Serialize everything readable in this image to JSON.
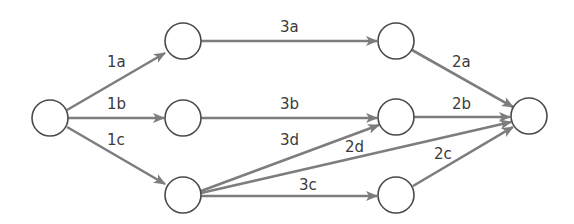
{
  "diagram": {
    "type": "directed-network",
    "colors": {
      "edge": "#7d7d7d",
      "node_stroke": "#4a4a4a",
      "label": "#3a3a3a",
      "background": "#ffffff"
    },
    "nodes": [
      {
        "id": "source",
        "x": 50,
        "y": 118
      },
      {
        "id": "a1",
        "x": 183,
        "y": 41
      },
      {
        "id": "b1",
        "x": 183,
        "y": 118
      },
      {
        "id": "c1",
        "x": 183,
        "y": 195
      },
      {
        "id": "a2",
        "x": 396,
        "y": 41
      },
      {
        "id": "b2",
        "x": 396,
        "y": 117
      },
      {
        "id": "c2",
        "x": 396,
        "y": 195
      },
      {
        "id": "sink",
        "x": 529,
        "y": 116
      }
    ],
    "edges": [
      {
        "from": "source",
        "to": "a1",
        "label": "1a"
      },
      {
        "from": "source",
        "to": "b1",
        "label": "1b"
      },
      {
        "from": "source",
        "to": "c1",
        "label": "1c"
      },
      {
        "from": "a1",
        "to": "a2",
        "label": "3a"
      },
      {
        "from": "b1",
        "to": "b2",
        "label": "3b"
      },
      {
        "from": "c1",
        "to": "b2",
        "label": "3d"
      },
      {
        "from": "c1",
        "to": "c2",
        "label": "3c"
      },
      {
        "from": "c1",
        "to": "sink",
        "label": "2d"
      },
      {
        "from": "a2",
        "to": "sink",
        "label": "2a"
      },
      {
        "from": "b2",
        "to": "sink",
        "label": "2b"
      },
      {
        "from": "c2",
        "to": "sink",
        "label": "2c"
      }
    ]
  },
  "labels": {
    "e1a": "1a",
    "e1b": "1b",
    "e1c": "1c",
    "e3a": "3a",
    "e3b": "3b",
    "e3d": "3d",
    "e3c": "3c",
    "e2a": "2a",
    "e2b": "2b",
    "e2d": "2d",
    "e2c": "2c"
  }
}
